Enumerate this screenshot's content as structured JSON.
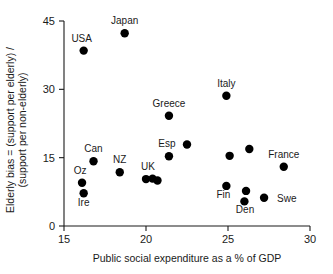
{
  "chart_data": {
    "type": "scatter",
    "title": "",
    "xlabel": "Public social expenditure as a % of GDP",
    "ylabel": "Elderly bias = (support per elderly) / (support per non-elderly)",
    "ylabel_line1": "Elderly bias = (support per elderly) /",
    "ylabel_line2": "(support per non-elderly)",
    "xlim": [
      15,
      30
    ],
    "ylim": [
      0,
      45
    ],
    "xticks": [
      15,
      20,
      25,
      30
    ],
    "xtick_labels": [
      "15",
      "20",
      "25",
      "30"
    ],
    "yticks": [
      0,
      15,
      30,
      45
    ],
    "ytick_labels": [
      "0",
      "15",
      "30",
      "45"
    ],
    "grid": false,
    "legend": "none",
    "marker": "filled-circle",
    "marker_color": "#000000",
    "points": [
      {
        "label": "USA",
        "x": 16.2,
        "y": 38.5,
        "label_dx": -2,
        "label_dy": -9,
        "anchor": "middle"
      },
      {
        "label": "Japan",
        "x": 18.7,
        "y": 42.3,
        "label_dx": 0,
        "label_dy": -9,
        "anchor": "middle"
      },
      {
        "label": "Italy",
        "x": 24.9,
        "y": 28.6,
        "label_dx": 0,
        "label_dy": -9,
        "anchor": "middle"
      },
      {
        "label": "Greece",
        "x": 21.4,
        "y": 24.2,
        "label_dx": 0,
        "label_dy": -9,
        "anchor": "middle"
      },
      {
        "label": "",
        "x": 22.5,
        "y": 17.9,
        "label_dx": 0,
        "label_dy": 0,
        "anchor": "middle"
      },
      {
        "label": "Esp",
        "x": 21.4,
        "y": 15.3,
        "label_dx": -2,
        "label_dy": -9,
        "anchor": "middle"
      },
      {
        "label": "",
        "x": 26.3,
        "y": 16.9,
        "label_dx": 0,
        "label_dy": 0,
        "anchor": "middle"
      },
      {
        "label": "",
        "x": 25.1,
        "y": 15.4,
        "label_dx": 0,
        "label_dy": 0,
        "anchor": "middle"
      },
      {
        "label": "Can",
        "x": 16.8,
        "y": 14.2,
        "label_dx": 0,
        "label_dy": -9,
        "anchor": "middle"
      },
      {
        "label": "France",
        "x": 28.4,
        "y": 13.0,
        "label_dx": 0,
        "label_dy": -9,
        "anchor": "middle"
      },
      {
        "label": "NZ",
        "x": 18.4,
        "y": 11.8,
        "label_dx": 0,
        "label_dy": -9,
        "anchor": "middle"
      },
      {
        "label": "UK",
        "x": 20.0,
        "y": 10.3,
        "label_dx": 2,
        "label_dy": -9,
        "anchor": "middle"
      },
      {
        "label": "",
        "x": 20.4,
        "y": 10.4,
        "label_dx": 0,
        "label_dy": 0,
        "anchor": "middle"
      },
      {
        "label": "",
        "x": 20.7,
        "y": 10.0,
        "label_dx": 0,
        "label_dy": 0,
        "anchor": "middle"
      },
      {
        "label": "Oz",
        "x": 16.1,
        "y": 9.5,
        "label_dx": -2,
        "label_dy": -9,
        "anchor": "middle"
      },
      {
        "label": "Fin",
        "x": 24.9,
        "y": 8.8,
        "label_dx": -3,
        "label_dy": 12,
        "anchor": "middle"
      },
      {
        "label": "Ire",
        "x": 16.2,
        "y": 7.2,
        "label_dx": 0,
        "label_dy": 13,
        "anchor": "middle"
      },
      {
        "label": "Den",
        "x": 26.1,
        "y": 7.7,
        "label_dx": -1,
        "label_dy": 22,
        "anchor": "middle"
      },
      {
        "label": "",
        "x": 26.0,
        "y": 5.4,
        "label_dx": 0,
        "label_dy": 0,
        "anchor": "middle"
      },
      {
        "label": "Swe",
        "x": 27.2,
        "y": 6.2,
        "label_dx": 13,
        "label_dy": 4,
        "anchor": "start"
      }
    ]
  }
}
